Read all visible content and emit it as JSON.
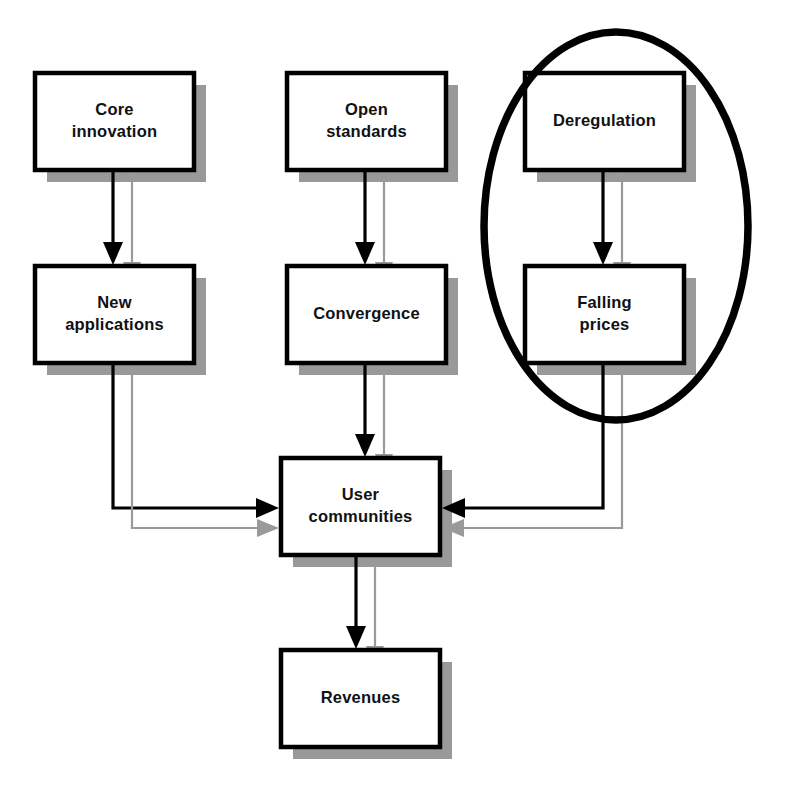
{
  "diagram": {
    "canvas": {
      "width": 789,
      "height": 799,
      "background": "#ffffff"
    },
    "style": {
      "box_fill": "#ffffff",
      "box_border": "#000000",
      "box_shadow": "#999999",
      "edge_primary": "#000000",
      "edge_secondary": "#9a9a9a",
      "highlight_stroke": "#000000"
    },
    "nodes": [
      {
        "id": "core-innovation",
        "label_line1": "Core",
        "label_line2": "innovation",
        "x": 35,
        "y": 73,
        "w": 159,
        "h": 97,
        "column": "left"
      },
      {
        "id": "open-standards",
        "label_line1": "Open",
        "label_line2": "standards",
        "x": 287,
        "y": 73,
        "w": 159,
        "h": 97,
        "column": "middle"
      },
      {
        "id": "deregulation",
        "label_line1": "Deregulation",
        "label_line2": "",
        "x": 525,
        "y": 73,
        "w": 159,
        "h": 97,
        "column": "right"
      },
      {
        "id": "new-applications",
        "label_line1": "New",
        "label_line2": "applications",
        "x": 35,
        "y": 266,
        "w": 159,
        "h": 97,
        "column": "left"
      },
      {
        "id": "convergence",
        "label_line1": "Convergence",
        "label_line2": "",
        "x": 287,
        "y": 266,
        "w": 159,
        "h": 97,
        "column": "middle"
      },
      {
        "id": "falling-prices",
        "label_line1": "Falling",
        "label_line2": "prices",
        "x": 525,
        "y": 266,
        "w": 159,
        "h": 97,
        "column": "right"
      },
      {
        "id": "user-communities",
        "label_line1": "User",
        "label_line2": "communities",
        "x": 281,
        "y": 458,
        "w": 159,
        "h": 97,
        "column": "middle"
      },
      {
        "id": "revenues",
        "label_line1": "Revenues",
        "label_line2": "",
        "x": 281,
        "y": 650,
        "w": 159,
        "h": 97,
        "column": "middle"
      }
    ],
    "highlight": {
      "id": "deregulation-falling-prices-highlight",
      "shape": "ellipse",
      "cx": 616,
      "cy": 226,
      "rx": 132,
      "ry": 194,
      "encloses": [
        "deregulation",
        "falling-prices"
      ]
    },
    "edges": [
      {
        "id": "core-to-new",
        "from": "core-innovation",
        "to": "new-applications",
        "style": "primary"
      },
      {
        "id": "core-to-new-shadow",
        "from": "core-innovation",
        "to": "new-applications",
        "style": "secondary"
      },
      {
        "id": "open-to-convergence",
        "from": "open-standards",
        "to": "convergence",
        "style": "primary"
      },
      {
        "id": "open-to-conv-shadow",
        "from": "open-standards",
        "to": "convergence",
        "style": "secondary"
      },
      {
        "id": "dereg-to-falling",
        "from": "deregulation",
        "to": "falling-prices",
        "style": "primary"
      },
      {
        "id": "dereg-to-fall-shadow",
        "from": "deregulation",
        "to": "falling-prices",
        "style": "secondary"
      },
      {
        "id": "new-to-users",
        "from": "new-applications",
        "to": "user-communities",
        "style": "primary"
      },
      {
        "id": "new-to-users-shadow",
        "from": "new-applications",
        "to": "user-communities",
        "style": "secondary"
      },
      {
        "id": "conv-to-users",
        "from": "convergence",
        "to": "user-communities",
        "style": "primary"
      },
      {
        "id": "conv-to-users-shadow",
        "from": "convergence",
        "to": "user-communities",
        "style": "secondary"
      },
      {
        "id": "falling-to-users",
        "from": "falling-prices",
        "to": "user-communities",
        "style": "primary"
      },
      {
        "id": "falling-to-users-shdw",
        "from": "falling-prices",
        "to": "user-communities",
        "style": "secondary"
      },
      {
        "id": "users-to-revenues",
        "from": "user-communities",
        "to": "revenues",
        "style": "primary"
      },
      {
        "id": "users-to-rev-shadow",
        "from": "user-communities",
        "to": "revenues",
        "style": "secondary"
      }
    ]
  }
}
